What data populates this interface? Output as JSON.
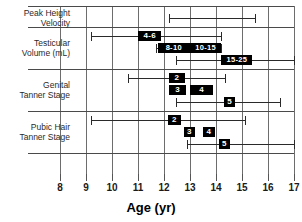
{
  "chart_data": {
    "type": "bar",
    "title": "",
    "xlabel": "Age (yr)",
    "ylabel": "",
    "xlim": [
      8,
      17
    ],
    "xticks": [
      8,
      9,
      10,
      11,
      12,
      13,
      14,
      15,
      16,
      17
    ],
    "xtick_labels": [
      "8",
      "9",
      "10",
      "11",
      "12",
      "13",
      "14",
      "15",
      "16",
      "17"
    ],
    "grid": true,
    "legend": "none",
    "orientation": "horizontal",
    "row_groups": [
      {
        "label_line1": "Peak Height",
        "label_line2": "Velocity",
        "rows": [
          {
            "range_start": 12.2,
            "range_end": 15.5,
            "boxes": []
          }
        ]
      },
      {
        "label_line1": "Testicular",
        "label_line2": "Volume (mL)",
        "rows": [
          {
            "range_start": 9.2,
            "range_end": 14.2,
            "boxes": [
              {
                "label": "4-6",
                "start": 11.0,
                "end": 11.9
              }
            ]
          },
          {
            "range_start": 11.7,
            "range_end": 14.2,
            "boxes": [
              {
                "label": "8-10",
                "start": 11.75,
                "end": 13.0
              },
              {
                "label": "10-15",
                "start": 13.0,
                "end": 14.2
              }
            ]
          },
          {
            "range_start": 12.45,
            "range_end": 17.0,
            "boxes": [
              {
                "label": "15-25",
                "start": 14.2,
                "end": 15.4
              }
            ]
          }
        ]
      },
      {
        "label_line1": "Genital",
        "label_line2": "Tanner Stage",
        "rows": [
          {
            "range_start": 10.6,
            "range_end": 14.35,
            "boxes": [
              {
                "label": "2",
                "start": 12.2,
                "end": 12.8
              }
            ]
          },
          {
            "range_start": null,
            "range_end": null,
            "boxes": [
              {
                "label": "3",
                "start": 12.2,
                "end": 12.85
              },
              {
                "label": "4",
                "start": 13.0,
                "end": 13.9
              }
            ]
          },
          {
            "range_start": 12.45,
            "range_end": 16.45,
            "boxes": [
              {
                "label": "5",
                "start": 14.3,
                "end": 14.75
              }
            ]
          }
        ]
      },
      {
        "label_line1": "Pubic Hair",
        "label_line2": "Tanner Stage",
        "rows": [
          {
            "range_start": 9.2,
            "range_end": 15.1,
            "boxes": [
              {
                "label": "2",
                "start": 12.15,
                "end": 12.65
              }
            ]
          },
          {
            "range_start": null,
            "range_end": null,
            "boxes": [
              {
                "label": "3",
                "start": 12.75,
                "end": 13.2
              },
              {
                "label": "4",
                "start": 13.5,
                "end": 13.95
              }
            ]
          },
          {
            "range_start": 12.9,
            "range_end": 17.0,
            "boxes": [
              {
                "label": "5",
                "start": 14.1,
                "end": 14.55
              }
            ]
          }
        ]
      }
    ]
  },
  "axis": {
    "title": "Age (yr)"
  }
}
